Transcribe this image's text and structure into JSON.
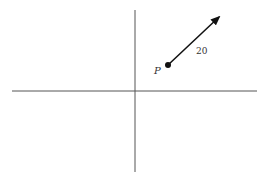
{
  "diagram": {
    "point_label": "P",
    "vector_magnitude_label": "20",
    "colors": {
      "axis": "#555555",
      "vector": "#111111",
      "text": "#333333"
    }
  }
}
